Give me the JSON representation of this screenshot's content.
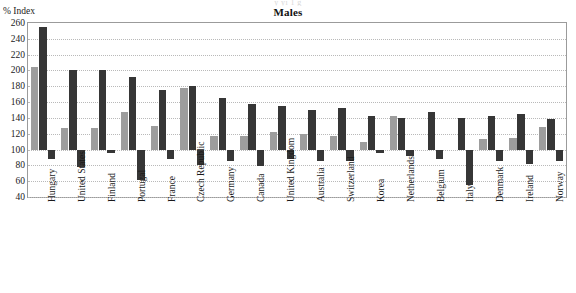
{
  "ghost_text": "y  yi                              1  g",
  "chart_title": "Males",
  "axis_unit_label": "% Index",
  "colors": {
    "series_gray": "#9d9d9d",
    "series_dark": "#363636",
    "frame": "#9b9b9b",
    "gridline": "#b9b9b9",
    "background": "#ffffff"
  },
  "chart_data": {
    "type": "bar",
    "title": "Males",
    "subtitle": "",
    "xlabel": "",
    "ylabel": "% Index",
    "ylim": [
      40,
      260
    ],
    "ytick_step": 20,
    "yticks": [
      40,
      60,
      80,
      100,
      120,
      140,
      160,
      180,
      200,
      220,
      240,
      260
    ],
    "baseline": 100,
    "grid": true,
    "legend": "none",
    "orientation": "vertical",
    "note": "Three bars per country: a light-grey positive bar, a dark positive bar, and a dark bar extending below the 100 baseline.",
    "categories": [
      "Hungary",
      "United States",
      "Finland",
      "Portugal",
      "France",
      "Czech Republic",
      "Germany",
      "Canada",
      "United Kingdom",
      "Australia",
      "Switzerland",
      "Korea",
      "Netherlands",
      "Belgium",
      "Italy",
      "Denmark",
      "Ireland",
      "Norway"
    ],
    "series": [
      {
        "name": "series-gray",
        "color": "#9d9d9d",
        "values": [
          205,
          127,
          127,
          148,
          130,
          178,
          117,
          117,
          122,
          120,
          117,
          110,
          143,
          100,
          100,
          113,
          115,
          128
        ]
      },
      {
        "name": "series-dark",
        "color": "#363636",
        "values": [
          255,
          200,
          200,
          192,
          175,
          180,
          165,
          158,
          155,
          150,
          152,
          143,
          140,
          148,
          140,
          143,
          145,
          138
        ]
      },
      {
        "name": "series-below-baseline",
        "color": "#363636",
        "values": [
          88,
          78,
          95,
          62,
          88,
          80,
          86,
          79,
          88,
          86,
          85,
          95,
          92,
          88,
          55,
          86,
          82,
          86
        ]
      }
    ]
  }
}
